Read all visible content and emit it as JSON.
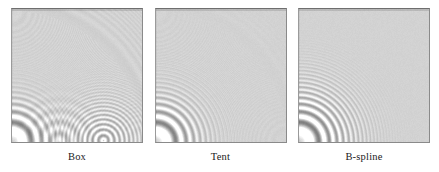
{
  "figure": {
    "background_color": "#ffffff",
    "panel_fill_color": "#d2d2d2",
    "panel_border_color": "#8a8a8a",
    "caption_color": "#1a1a1a"
  },
  "chart_data": {
    "type": "heatmap",
    "subtitle": "",
    "xlabel": "",
    "ylabel": "",
    "grid": false,
    "legend_position": "none",
    "panels": [
      {
        "index": 0,
        "label": "Box",
        "filter": "box",
        "filter_order": 0,
        "filter_support_radius": 0.5,
        "alias_strength": 1.0,
        "alias_extent_fraction": 0.95,
        "ringing_contrast": 0.62,
        "notes": "Strongest aliasing: moire rings extend across the whole panel with secondary ghost rosettes near the bottom edge."
      },
      {
        "index": 1,
        "label": "Tent",
        "filter": "tent",
        "filter_order": 1,
        "filter_support_radius": 1.0,
        "alias_strength": 0.42,
        "alias_extent_fraction": 0.45,
        "ringing_contrast": 0.55,
        "notes": "Moderate aliasing: artifacts confined to the lower-left quadrant, fading quickly with radius."
      },
      {
        "index": 2,
        "label": "B-spline",
        "filter": "b-spline",
        "filter_order": 3,
        "filter_support_radius": 2.0,
        "alias_strength": 0.18,
        "alias_extent_fraction": 0.28,
        "ringing_contrast": 0.48,
        "notes": "Least aliasing: only a small ring cluster remains at the bottom-left corner; the rest is smooth gray."
      }
    ],
    "signal": {
      "function": "0.5 + 0.5*sin(k*r^2)",
      "center_normalized": [
        0.0,
        1.0
      ],
      "center_description": "bottom-left corner of each panel",
      "max_gray": 255,
      "min_gray": 0,
      "mean_gray": 210
    },
    "axis_ranges": {
      "x": [
        0,
        1
      ],
      "y": [
        0,
        1
      ]
    }
  },
  "panels": [
    {
      "label": "Box"
    },
    {
      "label": "Tent"
    },
    {
      "label": "B-spline"
    }
  ]
}
